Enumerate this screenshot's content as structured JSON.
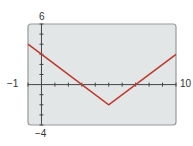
{
  "chart_data": {
    "type": "line",
    "title": "",
    "xlabel": "",
    "ylabel": "",
    "xlim": [
      -1,
      10
    ],
    "ylim": [
      -4,
      6
    ],
    "x_tick_spacing": 1,
    "y_tick_spacing": 1,
    "grid": false,
    "window_labels": {
      "xmin": "−1",
      "xmax": "10",
      "ymin": "−4",
      "ymax": "6"
    },
    "series": [
      {
        "name": "y = |x - 5| - 2",
        "color": "#c0392b",
        "x": [
          -1,
          5,
          10
        ],
        "y": [
          4,
          -2,
          3
        ]
      }
    ],
    "frame_color": "#9a9a9a",
    "background_color": "#e3e6e6",
    "axis_color": "#444444"
  }
}
